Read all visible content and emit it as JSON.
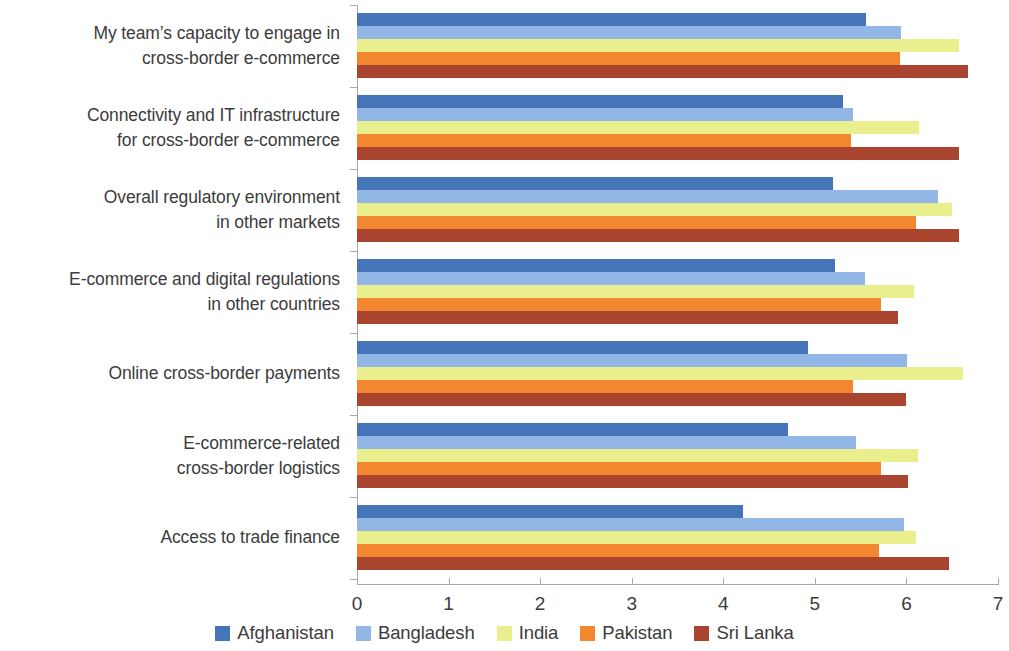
{
  "chart_data": {
    "type": "bar",
    "orientation": "horizontal",
    "title": "",
    "xlabel": "",
    "ylabel": "",
    "xlim": [
      0,
      7
    ],
    "xticks": [
      "0",
      "1",
      "2",
      "3",
      "4",
      "5",
      "6",
      "7"
    ],
    "grid": false,
    "legend_position": "bottom",
    "categories": [
      "My team’s capacity to engage in\ncross-border e-commerce",
      "Connectivity and IT infrastructure\nfor cross-border e-commerce",
      "Overall regulatory environment\nin other markets",
      "E-commerce and digital regulations\nin other countries",
      "Online cross-border payments",
      "E-commerce-related\ncross-border logistics",
      "Access to trade finance"
    ],
    "series": [
      {
        "name": "Afghanistan",
        "color": "#4574b8",
        "values": [
          5.56,
          5.31,
          5.2,
          5.22,
          4.93,
          4.71,
          4.22
        ]
      },
      {
        "name": "Bangladesh",
        "color": "#92b6e5",
        "values": [
          5.94,
          5.42,
          6.34,
          5.55,
          6.01,
          5.45,
          5.97
        ]
      },
      {
        "name": "India",
        "color": "#e9ef8d",
        "values": [
          6.57,
          6.14,
          6.5,
          6.08,
          6.62,
          6.13,
          6.1
        ]
      },
      {
        "name": "Pakistan",
        "color": "#f2872f",
        "values": [
          5.93,
          5.4,
          6.1,
          5.72,
          5.42,
          5.72,
          5.7
        ]
      },
      {
        "name": "Sri Lanka",
        "color": "#a9452f",
        "values": [
          6.67,
          6.57,
          6.57,
          5.91,
          5.99,
          6.02,
          6.46
        ]
      }
    ]
  },
  "legend": {
    "items": [
      {
        "label": "Afghanistan",
        "color": "#4574b8"
      },
      {
        "label": "Bangladesh",
        "color": "#92b6e5"
      },
      {
        "label": "India",
        "color": "#e9ef8d"
      },
      {
        "label": "Pakistan",
        "color": "#f2872f"
      },
      {
        "label": "Sri Lanka",
        "color": "#a9452f"
      }
    ]
  },
  "axis": {
    "color": "#a8a8a8"
  }
}
